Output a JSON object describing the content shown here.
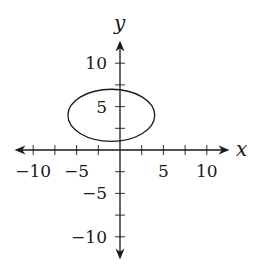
{
  "chart_data": {
    "type": "line",
    "title": "",
    "xlabel": "x",
    "ylabel": "y",
    "xlim": [
      -12.5,
      12.5
    ],
    "ylim": [
      -12.5,
      12.5
    ],
    "grid": false,
    "legend": null,
    "x_ticks": [
      -10,
      -7.5,
      -5,
      -2.5,
      0,
      2.5,
      5,
      7.5,
      10
    ],
    "y_ticks": [
      -10,
      -7.5,
      -5,
      -2.5,
      0,
      2.5,
      5,
      7.5,
      10
    ],
    "x_tick_labels": [
      {
        "value": -10,
        "text": "−10"
      },
      {
        "value": -5,
        "text": "−5"
      },
      {
        "value": 5,
        "text": "5"
      },
      {
        "value": 10,
        "text": "10"
      }
    ],
    "y_tick_labels": [
      {
        "value": 10,
        "text": "10"
      },
      {
        "value": 5,
        "text": "5"
      },
      {
        "value": -5,
        "text": "−5"
      },
      {
        "value": -10,
        "text": "−10"
      }
    ],
    "series": [
      {
        "name": "ellipse",
        "shape": "ellipse",
        "center": [
          -1,
          4
        ],
        "rx": 5,
        "ry": 3,
        "equation": "(x+1)^2/25 + (y-4)^2/9 = 1",
        "color": "#1a1a1a"
      }
    ]
  },
  "labels": {
    "x_axis": "x",
    "y_axis": "y"
  }
}
